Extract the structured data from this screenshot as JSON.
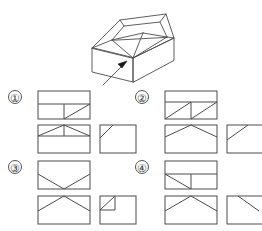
{
  "page": {
    "type": "orthographic-projection-multiple-choice",
    "background_color": "#ffffff",
    "line_color": "#4d4d4d",
    "label_color": "#333333"
  },
  "figure": {
    "name": "3d-solid-with-view-arrow",
    "arrow_label": "",
    "arrow_direction": "toward-upper-right"
  },
  "options": [
    {
      "id": "1",
      "label": "①",
      "views": [
        {
          "name": "view-top",
          "width": 52,
          "height": 28,
          "features": [
            "outer-rectangle",
            "horizontal-divider-mid",
            "vertical-divider-lower-center",
            "diagonal-lower-right-bl-to-tr"
          ]
        },
        {
          "name": "view-front",
          "width": 52,
          "height": 28,
          "features": [
            "outer-rectangle",
            "horizontal-divider-upper",
            "diagonal-left-up-to-apex",
            "diagonal-right-up-to-apex",
            "vertical-center-short"
          ]
        },
        {
          "name": "view-side",
          "width": 36,
          "height": 28,
          "features": [
            "outer-rectangle",
            "short-diagonal-top-left-corner"
          ]
        }
      ]
    },
    {
      "id": "2",
      "label": "②",
      "views": [
        {
          "name": "view-top",
          "width": 52,
          "height": 28,
          "features": [
            "outer-rectangle",
            "horizontal-divider-mid",
            "diagonal-left-bl-to-tr",
            "diagonal-right-bl-to-tr",
            "vertical-divider-center-lower"
          ]
        },
        {
          "name": "view-front",
          "width": 52,
          "height": 28,
          "features": [
            "outer-rectangle",
            "diagonal-left-up-to-apex",
            "diagonal-right-up-to-apex"
          ]
        },
        {
          "name": "view-side",
          "width": 36,
          "height": 28,
          "features": [
            "outer-rectangle",
            "diagonal-bottom-left-to-top-right-partial"
          ]
        }
      ]
    },
    {
      "id": "3",
      "label": "③",
      "views": [
        {
          "name": "view-top",
          "width": 52,
          "height": 28,
          "features": [
            "outer-rectangle",
            "diagonal-left-down-to-bottom-center",
            "diagonal-right-down-to-bottom-center"
          ]
        },
        {
          "name": "view-front",
          "width": 52,
          "height": 28,
          "features": [
            "outer-rectangle",
            "diagonal-left-up-to-apex",
            "diagonal-right-up-to-apex"
          ]
        },
        {
          "name": "view-side",
          "width": 36,
          "height": 28,
          "features": [
            "outer-rectangle",
            "small-square-top-left",
            "diagonal-inside-small-square"
          ]
        }
      ]
    },
    {
      "id": "4",
      "label": "④",
      "views": [
        {
          "name": "view-top",
          "width": 52,
          "height": 28,
          "features": [
            "outer-rectangle",
            "horizontal-divider-mid",
            "diagonal-lower-left-tl-to-br",
            "vertical-divider-center-lower"
          ]
        },
        {
          "name": "view-front",
          "width": 52,
          "height": 28,
          "features": [
            "outer-rectangle",
            "diagonal-left-up-to-apex",
            "diagonal-right-up-to-apex"
          ]
        },
        {
          "name": "view-side",
          "width": 36,
          "height": 28,
          "features": [
            "outer-rectangle",
            "diagonal-top-left-down-to-right"
          ]
        }
      ]
    }
  ]
}
